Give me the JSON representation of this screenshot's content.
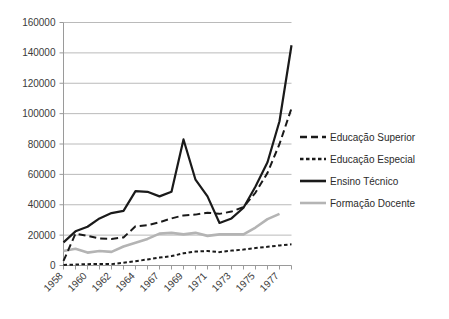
{
  "chart_data": {
    "type": "line",
    "title": "",
    "subtitle": "",
    "xlabel": "",
    "ylabel": "",
    "ylim": [
      0,
      160000
    ],
    "ytick_values": [
      0,
      20000,
      40000,
      60000,
      80000,
      100000,
      120000,
      140000,
      160000
    ],
    "ytick_labels": [
      "0",
      "20000",
      "40000",
      "60000",
      "80000",
      "100000",
      "120000",
      "140000",
      "160000"
    ],
    "grid": true,
    "legend_position": "right",
    "x": [
      1958,
      1959,
      1960,
      1961,
      1962,
      1963,
      1964,
      1965,
      1966,
      1967,
      1968,
      1969,
      1970,
      1971,
      1972,
      1973,
      1974,
      1975,
      1976,
      1977
    ],
    "categories": [
      "1958",
      "1959",
      "1960",
      "1961",
      "1962",
      "1963",
      "1964",
      "1965",
      "1966",
      "1967",
      "1968",
      "1969",
      "1970",
      "1971",
      "1972",
      "1973",
      "1974",
      "1975",
      "1976",
      "1977"
    ],
    "xtick_labels_shown": [
      "1958",
      "1960",
      "1962",
      "1964",
      "1967",
      "1969",
      "1971",
      "1973",
      "1975",
      "1977"
    ],
    "series": [
      {
        "name": "Educação Superior",
        "style": "dashed-long",
        "color": "#1a1a1a",
        "values": [
          3000,
          21000,
          19500,
          17800,
          17500,
          18500,
          25800,
          26500,
          28500,
          31000,
          33000,
          33500,
          34800,
          34000,
          35500,
          38500,
          48000,
          61000,
          80000,
          103500
        ]
      },
      {
        "name": "Educação Especial",
        "style": "dashed-short",
        "color": "#1a1a1a",
        "values": [
          400,
          600,
          900,
          1000,
          900,
          1800,
          2800,
          4000,
          5200,
          6200,
          8000,
          9200,
          9500,
          8800,
          9800,
          10500,
          11500,
          12300,
          13200,
          14000
        ]
      },
      {
        "name": "Ensino Técnico",
        "style": "solid",
        "color": "#1a1a1a",
        "values": [
          15200,
          22500,
          25500,
          31000,
          34500,
          36000,
          49000,
          48500,
          45500,
          48500,
          83000,
          56500,
          45500,
          28000,
          31000,
          38000,
          52000,
          68000,
          95000,
          145000
        ]
      },
      {
        "name": "Formação Docente",
        "style": "solid",
        "color": "#b4b4b4",
        "values": [
          9500,
          11000,
          8500,
          9500,
          9000,
          12500,
          15000,
          17500,
          21000,
          21500,
          20500,
          21500,
          19500,
          20500,
          20500,
          20500,
          25000,
          30500,
          34000,
          null
        ]
      }
    ]
  },
  "legend": {
    "items": [
      {
        "label": "Educação Superior"
      },
      {
        "label": "Educação Especial"
      },
      {
        "label": "Ensino Técnico"
      },
      {
        "label": "Formação Docente"
      }
    ]
  }
}
